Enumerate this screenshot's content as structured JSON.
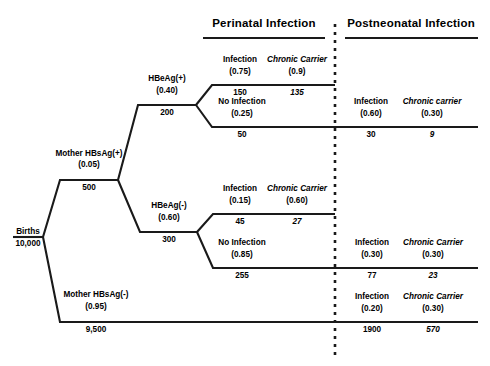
{
  "figure": {
    "type": "decision-tree",
    "headers": [
      {
        "label": "Perinatal Infection"
      },
      {
        "label": "Postneonatal Infection"
      }
    ]
  },
  "root": {
    "label": "Births",
    "count": "10,000"
  },
  "branches": {
    "mother_pos": {
      "label": "Mother HBsAg(+)",
      "prob": "(0.05)",
      "count": "500"
    },
    "mother_neg": {
      "label": "Mother HBsAg(-)",
      "prob": "(0.95)",
      "count": "9,500"
    },
    "hbeag_pos": {
      "label": "HBeAg(+)",
      "prob": "(0.40)",
      "count": "200"
    },
    "hbeag_neg": {
      "label": "HBeAg(-)",
      "prob": "(0.60)",
      "count": "300"
    }
  },
  "perinatal": {
    "row1": {
      "infection": {
        "label": "Infection",
        "prob": "(0.75)",
        "count": "150"
      },
      "carrier": {
        "label": "Chronic Carrier",
        "prob": "(0.9)",
        "count": "135"
      }
    },
    "row2": {
      "infection": {
        "label": "No Infection",
        "prob": "(0.25)",
        "count": "50"
      }
    },
    "row3": {
      "infection": {
        "label": "Infection",
        "prob": "(0.15)",
        "count": "45"
      },
      "carrier": {
        "label": "Chronic Carrier",
        "prob": "(0.60)",
        "count": "27"
      }
    },
    "row4": {
      "infection": {
        "label": "No Infection",
        "prob": "(0.85)",
        "count": "255"
      }
    }
  },
  "postneonatal": {
    "row2": {
      "infection": {
        "label": "Infection",
        "prob": "(0.60)",
        "count": "30"
      },
      "carrier": {
        "label": "Chronic carrier",
        "prob": "(0.30)",
        "count": "9"
      }
    },
    "row4": {
      "infection": {
        "label": "Infection",
        "prob": "(0.30)",
        "count": "77"
      },
      "carrier": {
        "label": "Chronic Carrier",
        "prob": "(0.30)",
        "count": "23"
      }
    },
    "row5": {
      "infection": {
        "label": "Infection",
        "prob": "(0.20)",
        "count": "1900"
      },
      "carrier": {
        "label": "Chronic Carrier",
        "prob": "(0.30)",
        "count": "570"
      }
    }
  },
  "colors": {
    "line": "#1a1a1a",
    "text": "#000000",
    "background": "#ffffff"
  }
}
